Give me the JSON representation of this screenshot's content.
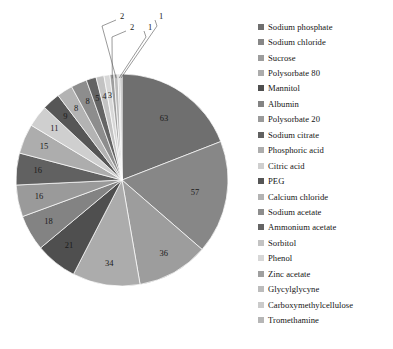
{
  "chart_data": {
    "type": "pie",
    "title": "",
    "xlabel": "",
    "ylabel": "",
    "legend_position": "right",
    "grid": false,
    "categories": [
      "Sodium phosphate",
      "Sodium chloride",
      "Sucrose",
      "Polysorbate 80",
      "Mannitol",
      "Albumin",
      "Polysorbate 20",
      "Sodium citrate",
      "Phosphoric acid",
      "Citric acid",
      "PEG",
      "Calcium chloride",
      "Sodium acetate",
      "Ammonium acetate",
      "Sorbitol",
      "Phenol",
      "Zinc acetate",
      "Glycylglycyne",
      "Carboxymethylcellulose",
      "Tromethamine"
    ],
    "values": [
      63,
      57,
      36,
      34,
      21,
      18,
      16,
      16,
      15,
      11,
      9,
      8,
      8,
      5,
      4,
      3,
      2,
      2,
      1,
      1
    ],
    "colors": [
      "#6f6f6f",
      "#878787",
      "#9d9d9d",
      "#acacac",
      "#4f4f4f",
      "#838383",
      "#9a9a9a",
      "#616161",
      "#adadad",
      "#cfcfcf",
      "#565656",
      "#b3b3b3",
      "#8d8d8d",
      "#646464",
      "#c3c3c3",
      "#d7d7d7",
      "#9f9f9f",
      "#bcbcbc",
      "#cbcbcb",
      "#b6b6b6"
    ],
    "labels": [
      "63",
      "57",
      "36",
      "34",
      "21",
      "18",
      "16",
      "16",
      "15",
      "11",
      "9",
      "8",
      "8",
      "5",
      "4",
      "3",
      "2",
      "2",
      "1",
      "1"
    ]
  },
  "legend": {
    "items": [
      {
        "label": "Sodium phosphate"
      },
      {
        "label": "Sodium chloride"
      },
      {
        "label": "Sucrose"
      },
      {
        "label": "Polysorbate 80"
      },
      {
        "label": "Mannitol"
      },
      {
        "label": "Albumin"
      },
      {
        "label": "Polysorbate 20"
      },
      {
        "label": "Sodium citrate"
      },
      {
        "label": "Phosphoric acid"
      },
      {
        "label": "Citric acid"
      },
      {
        "label": "PEG"
      },
      {
        "label": "Calcium chloride"
      },
      {
        "label": "Sodium acetate"
      },
      {
        "label": "Ammonium acetate"
      },
      {
        "label": "Sorbitol"
      },
      {
        "label": "Phenol"
      },
      {
        "label": "Zinc acetate"
      },
      {
        "label": "Glycylglycyne"
      },
      {
        "label": "Carboxymethylcellulose"
      },
      {
        "label": "Tromethamine"
      }
    ]
  }
}
